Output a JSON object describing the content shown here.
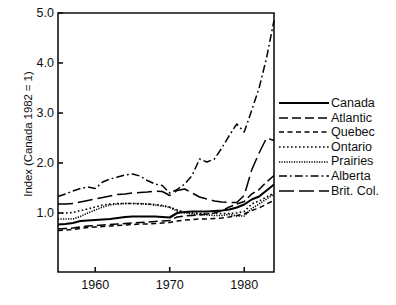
{
  "chart_data": {
    "type": "line",
    "title": "",
    "xlabel": "",
    "ylabel": "Index (Canada 1982 = 1)",
    "xlim": [
      1955,
      1984
    ],
    "ylim": [
      0.55,
      5.0
    ],
    "grid": false,
    "legend_position": "right",
    "xticks": [
      1960,
      1970,
      1980
    ],
    "xtick_labels": [
      "1960",
      "1970",
      "1980"
    ],
    "yticks": [
      1.0,
      2.0,
      3.0,
      4.0,
      5.0
    ],
    "ytick_labels": [
      "1.0",
      "2.0",
      "3.0",
      "4.0",
      "5.0"
    ],
    "x": [
      1955,
      1956,
      1957,
      1958,
      1959,
      1960,
      1961,
      1962,
      1963,
      1964,
      1965,
      1966,
      1967,
      1968,
      1969,
      1970,
      1971,
      1972,
      1973,
      1974,
      1975,
      1976,
      1977,
      1978,
      1979,
      1980,
      1981,
      1982,
      1983,
      1984
    ],
    "series": [
      {
        "name": "Canada",
        "style": "solid",
        "color": "#000000",
        "values": [
          0.77,
          0.78,
          0.8,
          0.84,
          0.85,
          0.86,
          0.87,
          0.88,
          0.9,
          0.92,
          0.93,
          0.93,
          0.93,
          0.93,
          0.92,
          0.91,
          1.0,
          1.02,
          1.03,
          1.03,
          1.03,
          1.04,
          1.05,
          1.07,
          1.11,
          1.17,
          1.27,
          1.33,
          1.45,
          1.57
        ]
      },
      {
        "name": "Atlantic",
        "style": "dashed-long",
        "color": "#000000",
        "values": [
          0.68,
          0.69,
          0.7,
          0.72,
          0.74,
          0.75,
          0.76,
          0.77,
          0.78,
          0.79,
          0.8,
          0.81,
          0.82,
          0.83,
          0.84,
          0.85,
          0.92,
          0.94,
          0.95,
          0.96,
          0.98,
          1.0,
          1.05,
          1.12,
          1.18,
          1.23,
          1.38,
          1.47,
          1.62,
          1.75
        ]
      },
      {
        "name": "Quebec",
        "style": "dashed-medium",
        "color": "#000000",
        "values": [
          0.65,
          0.66,
          0.67,
          0.69,
          0.71,
          0.72,
          0.73,
          0.74,
          0.75,
          0.76,
          0.77,
          0.78,
          0.78,
          0.79,
          0.8,
          0.81,
          0.84,
          0.86,
          0.87,
          0.88,
          0.88,
          0.89,
          0.9,
          0.92,
          0.95,
          0.98,
          1.05,
          1.1,
          1.18,
          1.25
        ]
      },
      {
        "name": "Ontario",
        "style": "dotted",
        "color": "#000000",
        "values": [
          1.0,
          1.0,
          1.01,
          1.05,
          1.08,
          1.12,
          1.16,
          1.18,
          1.19,
          1.19,
          1.19,
          1.18,
          1.18,
          1.17,
          1.15,
          1.12,
          1.06,
          1.02,
          1.0,
          0.99,
          0.99,
          0.99,
          0.99,
          0.99,
          1.0,
          1.03,
          1.18,
          1.24,
          1.32,
          1.4
        ]
      },
      {
        "name": "Prairies",
        "style": "dotted-fine",
        "color": "#000000",
        "values": [
          0.88,
          0.88,
          0.88,
          0.93,
          1.0,
          1.06,
          1.12,
          1.16,
          1.18,
          1.19,
          1.19,
          1.19,
          1.18,
          1.16,
          1.14,
          1.11,
          1.04,
          1.0,
          0.98,
          0.97,
          0.96,
          0.95,
          0.95,
          0.97,
          0.94,
          0.94,
          1.09,
          1.18,
          1.28,
          1.38
        ]
      },
      {
        "name": "Alberta",
        "style": "dash-dot",
        "color": "#000000",
        "values": [
          1.33,
          1.38,
          1.44,
          1.49,
          1.52,
          1.49,
          1.62,
          1.68,
          1.72,
          1.76,
          1.78,
          1.74,
          1.65,
          1.58,
          1.55,
          1.4,
          1.47,
          1.58,
          1.75,
          2.08,
          2.02,
          2.08,
          2.3,
          2.55,
          2.78,
          2.62,
          3.05,
          3.5,
          4.1,
          4.85
        ]
      },
      {
        "name": "Brit. Col.",
        "style": "dashed-xlong",
        "color": "#000000",
        "values": [
          1.18,
          1.18,
          1.19,
          1.22,
          1.25,
          1.28,
          1.31,
          1.34,
          1.37,
          1.38,
          1.4,
          1.41,
          1.42,
          1.44,
          1.43,
          1.35,
          1.45,
          1.48,
          1.4,
          1.32,
          1.28,
          1.24,
          1.22,
          1.21,
          1.21,
          1.35,
          1.86,
          2.2,
          2.5,
          2.45
        ]
      }
    ],
    "legend_entries": [
      {
        "label": "Canada",
        "style": "solid"
      },
      {
        "label": "Atlantic",
        "style": "dashed-long"
      },
      {
        "label": "Quebec",
        "style": "dashed-medium"
      },
      {
        "label": "Ontario",
        "style": "dotted"
      },
      {
        "label": "Prairies",
        "style": "dotted-fine"
      },
      {
        "label": "Alberta",
        "style": "dash-dot"
      },
      {
        "label": "Brit. Col.",
        "style": "dashed-xlong"
      }
    ]
  },
  "plot": {
    "frame_color": "#111111",
    "background": "#ffffff"
  }
}
